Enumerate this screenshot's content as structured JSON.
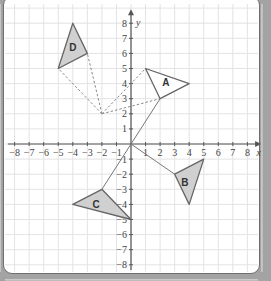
{
  "diagram": {
    "type": "coordinate-grid-transformations",
    "x_axis": {
      "label": "x",
      "min": -8,
      "max": 8,
      "ticks": [
        -8,
        -7,
        -6,
        -5,
        -4,
        -3,
        -2,
        -1,
        1,
        2,
        3,
        4,
        5,
        6,
        7,
        8
      ]
    },
    "y_axis": {
      "label": "y",
      "min": -8,
      "max": 8,
      "ticks": [
        8,
        7,
        6,
        5,
        4,
        3,
        2,
        1,
        -1,
        -2,
        -3,
        -4,
        -5,
        -6,
        -7,
        -8
      ]
    },
    "shapes": [
      {
        "label": "A",
        "vertices": [
          [
            1,
            5
          ],
          [
            4,
            4
          ],
          [
            2,
            3
          ]
        ],
        "fill": "#ffffff",
        "label_pos": [
          2.4,
          4.1
        ]
      },
      {
        "label": "B",
        "vertices": [
          [
            3,
            -2
          ],
          [
            5,
            -1
          ],
          [
            4,
            -4
          ]
        ],
        "fill": "#d0d0d0",
        "label_pos": [
          3.7,
          -2.5
        ]
      },
      {
        "label": "C",
        "vertices": [
          [
            -2,
            -3
          ],
          [
            -4,
            -4
          ],
          [
            0,
            -5
          ]
        ],
        "fill": "#d0d0d0",
        "label_pos": [
          -2.4,
          -4.0
        ]
      },
      {
        "label": "D",
        "vertices": [
          [
            -4,
            8
          ],
          [
            -3,
            6
          ],
          [
            -5,
            5
          ]
        ],
        "fill": "#d0d0d0",
        "label_pos": [
          -4.0,
          6.4
        ]
      }
    ],
    "dashed_lines": [
      [
        [
          -2,
          2
        ],
        [
          1,
          5
        ]
      ],
      [
        [
          -2,
          2
        ],
        [
          2,
          3
        ]
      ],
      [
        [
          -2,
          2
        ],
        [
          -5,
          5
        ]
      ],
      [
        [
          -2,
          2
        ],
        [
          -3,
          6
        ]
      ]
    ],
    "solid_lines": [
      [
        [
          0,
          0
        ],
        [
          2,
          3
        ]
      ],
      [
        [
          0,
          0
        ],
        [
          3,
          -2
        ]
      ],
      [
        [
          0,
          0
        ],
        [
          -2,
          -3
        ]
      ]
    ],
    "colors": {
      "grid": "#e3e3e3",
      "axis": "#555555",
      "shape_stroke": "#666666",
      "dashed": "#8a8a8a"
    }
  }
}
